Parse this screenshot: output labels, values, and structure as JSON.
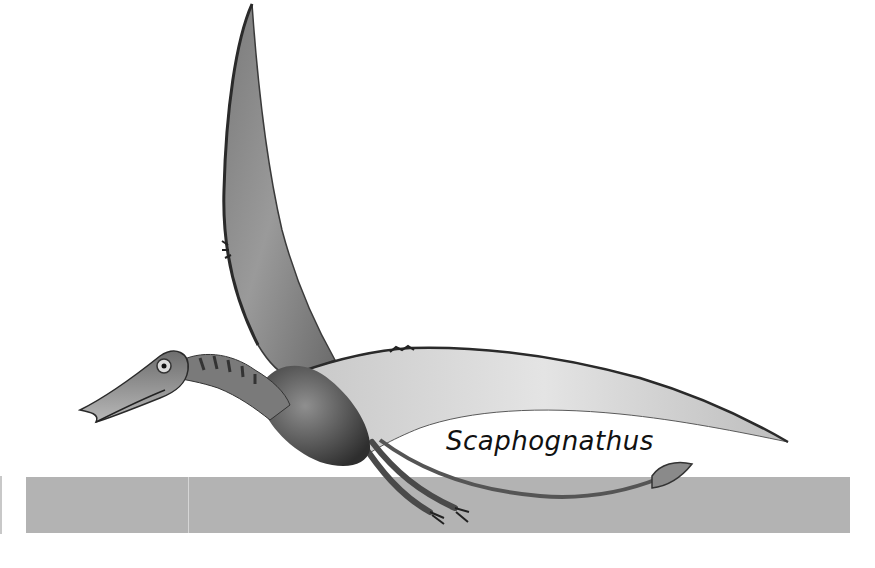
{
  "illustration": {
    "subject": "pterosaur-in-flight",
    "style": "grayscale",
    "species_label": "Scaphognathus"
  },
  "scale_bar": {
    "color": "#b3b3b3"
  },
  "colors": {
    "background": "#ffffff",
    "text": "#111111",
    "membrane_light": "#e6e6e6",
    "membrane_dark": "#8a8a8a",
    "body_dark": "#3a3a3a"
  }
}
